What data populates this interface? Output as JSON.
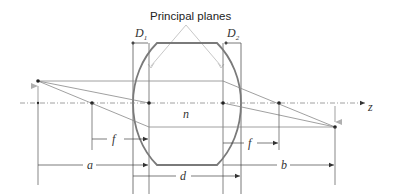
{
  "diagram": {
    "title": "Principal planes",
    "labels": {
      "D1": "D",
      "D1_sub": "1",
      "D2": "D",
      "D2_sub": "2",
      "n": "n",
      "z": "z",
      "f_left": "f",
      "f_right": "f",
      "a": "a",
      "b": "b",
      "d": "d"
    },
    "colors": {
      "lens": "#7a7a7a",
      "rays": "#8a8a8a",
      "construction": "#555555",
      "arrows_object_image": "#a0a0a0",
      "pointer_lines": "#c8c8c8"
    },
    "elements": [
      "thick lens with refractive index n",
      "principal planes (2)",
      "lens vertices D1 and D2",
      "optical axis z",
      "object point with upward arrow",
      "image point with downward arrow",
      "front and back focal points",
      "dimension f (front focal distance)",
      "dimension f (back focal distance)",
      "dimension a (object distance)",
      "dimension b (image distance)",
      "dimension d (lens thickness)"
    ]
  }
}
